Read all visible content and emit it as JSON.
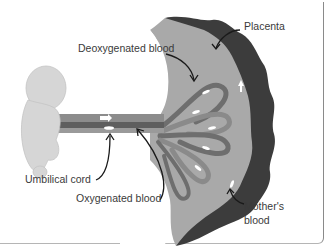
{
  "diagram": {
    "labels": {
      "deoxygenated": "Deoxygenated blood",
      "placenta": "Placenta",
      "umbilical_cord": "Umbilical cord",
      "oxygenated": "Oxygenated blood",
      "mothers_blood_line1": "Mother's",
      "mothers_blood_line2": "blood"
    },
    "colors": {
      "placenta_dark": "#3c3c3c",
      "placenta_light": "#a9a9a9",
      "vessel_dark": "#6e6e6e",
      "vessel_light": "#9a9a9a",
      "fetus": "#d6d6d6",
      "text": "#3a3a3a",
      "arrow": "#1a1a1a"
    }
  }
}
